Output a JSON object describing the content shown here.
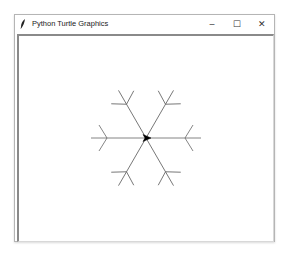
{
  "window": {
    "title": "Python Turtle Graphics",
    "icon": "feather-icon",
    "controls": {
      "minimize": "–",
      "maximize": "☐",
      "close": "✕"
    }
  },
  "canvas": {
    "background": "#ffffff",
    "stroke_color": "#555555",
    "drawing": "snowflake",
    "arms": 6,
    "turtle": {
      "shape": "arrow",
      "heading": "east",
      "color": "#000000"
    }
  }
}
